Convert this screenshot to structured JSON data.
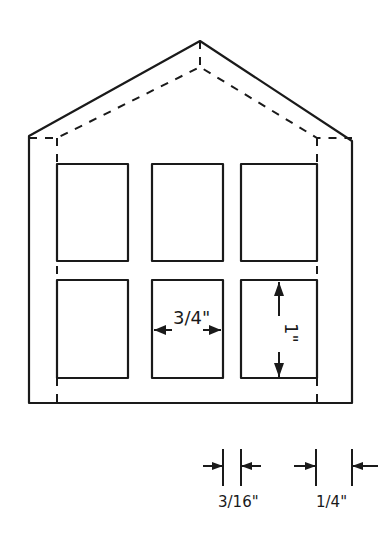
{
  "figure": {
    "type": "technical drawing",
    "line_color": "#1a1a1a",
    "background": "#ffffff"
  },
  "labels": {
    "window_width": "3/4\"",
    "window_height": "1\"",
    "dim_small": "3/16\"",
    "dim_quarter": "1/4\""
  },
  "dimensions": [
    {
      "name": "window-width",
      "value": "3/4\"",
      "orientation": "horizontal"
    },
    {
      "name": "window-height",
      "value": "1\"",
      "orientation": "vertical"
    },
    {
      "name": "inner-inset",
      "value": "3/16\""
    },
    {
      "name": "wall-thickness",
      "value": "1/4\""
    }
  ],
  "windows": {
    "rows": 2,
    "cols": 3
  }
}
